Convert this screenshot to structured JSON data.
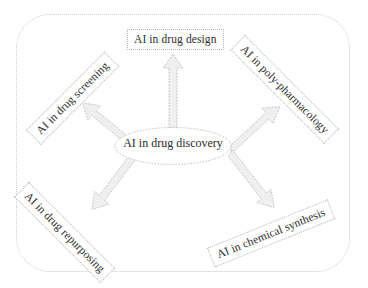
{
  "diagram": {
    "center": {
      "id": "center-node",
      "label": "AI in drug discovery",
      "shape": "ellipse",
      "fill": "#ffffff",
      "stroke": "#b9b9b9"
    },
    "nodes": [
      {
        "id": "drug-design",
        "label": "AI in drug design",
        "position": "top",
        "rotation_deg": 0,
        "shape": "rectangle"
      },
      {
        "id": "drug-screening",
        "label": "AI in drug screening",
        "position": "top-left",
        "rotation_deg": -45,
        "shape": "rectangle"
      },
      {
        "id": "poly-pharmacology",
        "label": "AI in poly-pharmacology",
        "position": "top-right",
        "rotation_deg": 45,
        "shape": "rectangle"
      },
      {
        "id": "drug-repurposing",
        "label": "AI in drug repurposing",
        "position": "bottom-left",
        "rotation_deg": 45,
        "shape": "rectangle"
      },
      {
        "id": "chemical-synthesis",
        "label": "AI in chemical synthesis",
        "position": "bottom-right",
        "rotation_deg": -22,
        "shape": "rectangle"
      }
    ],
    "connectors": [
      {
        "id": "arrow-to-drug-design",
        "from": "center-node",
        "to": "drug-design",
        "style": "block-arrow",
        "direction": "up"
      },
      {
        "id": "arrow-to-drug-screening",
        "from": "center-node",
        "to": "drug-screening",
        "style": "block-arrow",
        "direction": "up-left"
      },
      {
        "id": "arrow-to-poly-pharmacology",
        "from": "center-node",
        "to": "poly-pharmacology",
        "style": "block-arrow",
        "direction": "up-right"
      },
      {
        "id": "arrow-to-drug-repurposing",
        "from": "center-node",
        "to": "drug-repurposing",
        "style": "block-arrow",
        "direction": "down-left"
      },
      {
        "id": "arrow-to-chemical-synthesis",
        "from": "center-node",
        "to": "chemical-synthesis",
        "style": "block-arrow",
        "direction": "down-right"
      }
    ],
    "colors": {
      "background": "#ffffff",
      "frame_stroke": "#c9c9c9",
      "node_stroke": "#b5b5b5",
      "arrow_fill": "#efefef",
      "arrow_stroke": "#b0b0b0",
      "text": "#2b2b2b"
    }
  }
}
